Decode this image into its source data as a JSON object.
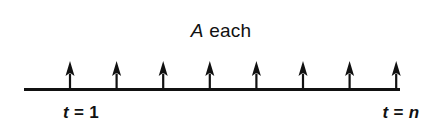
{
  "figure": {
    "name": "annuity-cash-flow-timeline",
    "background_color": "#ffffff",
    "ink_color": "#111111",
    "width": 442,
    "height": 133
  },
  "labels": {
    "annuity_symbol": "A",
    "annuity_suffix": "each",
    "period_start_symbol": "t",
    "period_start_equals": "=",
    "period_start_value": "1",
    "period_end_symbol": "t",
    "period_end_equals": "=",
    "period_end_value": "n"
  },
  "chart_data": {
    "type": "diagram",
    "axis": {
      "orientation": "horizontal",
      "x_start": 24,
      "x_end": 400,
      "y": 89,
      "stroke_width": 3,
      "grid": false
    },
    "tick_labels": [
      "t = 1",
      "t = n"
    ],
    "arrow_count": 8,
    "arrow_direction": "up",
    "arrow_value_label": "A",
    "arrow_spacing_px": 46.6,
    "arrow_positions_x": [
      70,
      116.6,
      163.2,
      209.8,
      256.4,
      303,
      349.6,
      396.2
    ],
    "arrow_tip_y": 61,
    "arrow_head_height": 15,
    "arrow_head_width": 9,
    "arrow_shaft_width": 2.2,
    "legend": []
  }
}
